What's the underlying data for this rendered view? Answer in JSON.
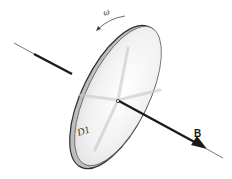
{
  "figure": {
    "labels": {
      "omega": "ω",
      "field": "B",
      "disk": "D1"
    },
    "colors": {
      "ink": "#1a1a1a",
      "disk_face": "#f4f4f4",
      "disk_shade": "#d8d8d8",
      "rim": "#3a3a3a",
      "background": "#ffffff"
    }
  }
}
